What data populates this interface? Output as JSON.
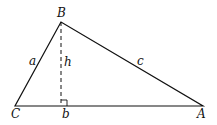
{
  "diagram": {
    "type": "triangle-with-altitude",
    "vertices": {
      "B": {
        "label": "B",
        "x": 61,
        "y": 22
      },
      "C": {
        "label": "C",
        "x": 15,
        "y": 106
      },
      "A": {
        "label": "A",
        "x": 203,
        "y": 106
      }
    },
    "sides": {
      "a": {
        "label": "a"
      },
      "b": {
        "label": "b"
      },
      "c": {
        "label": "c"
      }
    },
    "altitude": {
      "label": "h",
      "style": "dashed",
      "right_angle_marker": true
    },
    "colors": {
      "stroke": "#111111",
      "background": "#ffffff"
    }
  }
}
